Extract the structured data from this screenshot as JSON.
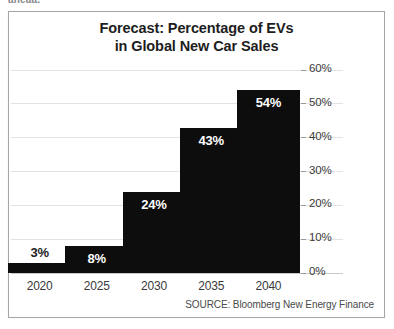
{
  "clipped_header_text": "aheaa.",
  "source_note": "SOURCE: Bloomberg New Energy Finance",
  "chart_data": {
    "type": "bar",
    "title": "Forecast: Percentage of EVs in Global New Car Sales",
    "title_lines": [
      "Forecast: Percentage of EVs",
      "in Global New Car Sales"
    ],
    "categories": [
      "2020",
      "2025",
      "2030",
      "2035",
      "2040"
    ],
    "values": [
      3,
      8,
      24,
      43,
      54
    ],
    "value_labels": [
      "3%",
      "8%",
      "24%",
      "43%",
      "54%"
    ],
    "label_placement": [
      "above",
      "inside",
      "inside",
      "inside",
      "inside"
    ],
    "xlabel": "",
    "ylabel": "",
    "ylim": [
      0,
      60
    ],
    "yticks": [
      0,
      10,
      20,
      30,
      40,
      50,
      60
    ],
    "ytick_labels": [
      "0%",
      "10%",
      "20%",
      "30%",
      "40%",
      "50%",
      "60%"
    ],
    "y_axis_position": "right",
    "grid": true,
    "legend": false,
    "bar_color": "#0d0d0d",
    "gridline_color": "#e3e3e3",
    "background_color": "#ffffff",
    "source": "SOURCE: Bloomberg New Energy Finance"
  }
}
